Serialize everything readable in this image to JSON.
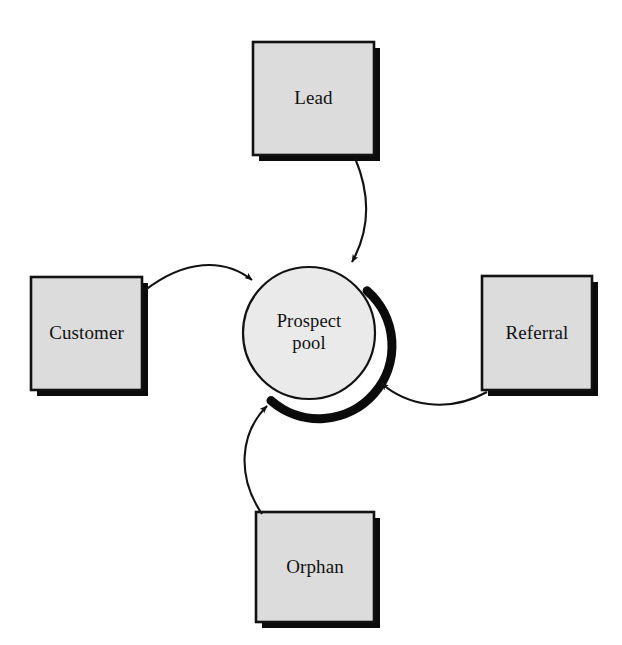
{
  "diagram": {
    "type": "hub-and-spoke",
    "background_color": "#ffffff",
    "hub": {
      "id": "prospect-pool",
      "label": "Prospect\npool",
      "shape": "circle",
      "center_x": 309,
      "center_y": 333,
      "radius": 66,
      "fill_color": "#e9e9e9",
      "stroke_color": "#000000",
      "shadow_color": "#000000"
    },
    "nodes": [
      {
        "id": "lead",
        "label": "Lead",
        "shape": "rectangle",
        "x": 253,
        "y": 42,
        "width": 121,
        "height": 113,
        "fill_color": "#dcdcdc",
        "stroke_color": "#000000",
        "shadow_color": "#000000",
        "position": "top"
      },
      {
        "id": "customer",
        "label": "Customer",
        "shape": "rectangle",
        "x": 31,
        "y": 277,
        "width": 111,
        "height": 113,
        "fill_color": "#dcdcdc",
        "stroke_color": "#000000",
        "shadow_color": "#000000",
        "position": "left"
      },
      {
        "id": "referral",
        "label": "Referral",
        "shape": "rectangle",
        "x": 482,
        "y": 276,
        "width": 110,
        "height": 114,
        "fill_color": "#dcdcdc",
        "stroke_color": "#000000",
        "shadow_color": "#000000",
        "position": "right"
      },
      {
        "id": "orphan",
        "label": "Orphan",
        "shape": "rectangle",
        "x": 256,
        "y": 512,
        "width": 118,
        "height": 110,
        "fill_color": "#dcdcdc",
        "stroke_color": "#000000",
        "shadow_color": "#000000",
        "position": "bottom"
      }
    ],
    "edges": [
      {
        "id": "lead-to-pool",
        "from": "lead",
        "to": "prospect-pool",
        "style": "curved",
        "arrowhead": "filled",
        "color": "#000000"
      },
      {
        "id": "customer-to-pool",
        "from": "customer",
        "to": "prospect-pool",
        "style": "curved",
        "arrowhead": "filled",
        "color": "#000000"
      },
      {
        "id": "referral-to-pool",
        "from": "referral",
        "to": "prospect-pool",
        "style": "curved",
        "arrowhead": "filled",
        "color": "#000000"
      },
      {
        "id": "orphan-to-pool",
        "from": "orphan",
        "to": "prospect-pool",
        "style": "curved",
        "arrowhead": "filled",
        "color": "#000000"
      }
    ]
  }
}
